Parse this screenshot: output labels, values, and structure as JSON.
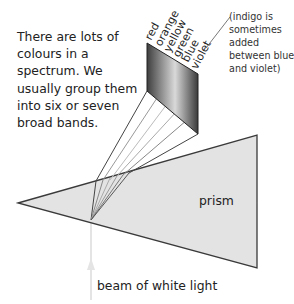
{
  "diagram": {
    "intro_text": "There are lots of colours in a spectrum. We usually group them into six or seven broad bands.",
    "note_text": "(indigo is sometimes added between blue and violet)",
    "prism_label": "prism",
    "beam_label": "beam of white light",
    "bands": [
      "red",
      "orange",
      "yellow",
      "green",
      "blue",
      "violet"
    ],
    "colors": {
      "prism_fill": "#e3e3e3",
      "outline": "#3a3a3a",
      "beam": "#e6e6e6",
      "screen_dark": "#4a4a4a",
      "screen_light": "#d8d8d8"
    }
  }
}
